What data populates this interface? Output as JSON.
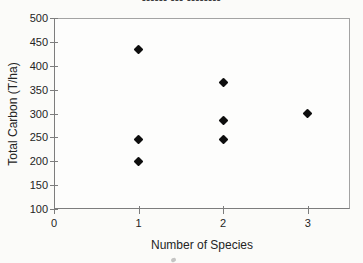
{
  "title": {
    "clipped": true,
    "mask_text": "▪▪▪▪▪▪ ▪▪▪ ▪▪▪▪▪▪▪▪"
  },
  "chart_data": {
    "type": "scatter",
    "xlabel": "Number of Species",
    "ylabel": "Total Carbon (T/ha)",
    "xlim": [
      0,
      3.5
    ],
    "ylim": [
      100,
      500
    ],
    "xticks": [
      0,
      1,
      2,
      3
    ],
    "yticks": [
      100,
      150,
      200,
      250,
      300,
      350,
      400,
      450,
      500
    ],
    "grid": false,
    "legend": false,
    "marker": "diamond",
    "marker_color": "#0e0e0e",
    "axis_color": "#7d7d7d",
    "label_color": "#242424",
    "points": [
      {
        "x": 1,
        "y": 435
      },
      {
        "x": 1,
        "y": 245
      },
      {
        "x": 1,
        "y": 200
      },
      {
        "x": 2,
        "y": 365
      },
      {
        "x": 2,
        "y": 285
      },
      {
        "x": 2,
        "y": 245
      },
      {
        "x": 3,
        "y": 300
      }
    ]
  }
}
